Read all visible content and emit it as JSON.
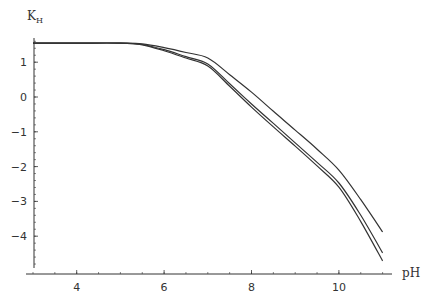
{
  "chart_data": {
    "type": "line",
    "title": "",
    "xlabel": "pH",
    "ylabel": "K",
    "ylabel_subscript": "H",
    "xlim": [
      3,
      11.1
    ],
    "ylim": [
      -5.1,
      1.7
    ],
    "grid": false,
    "legend": null,
    "x_ticks": [
      4,
      6,
      8,
      10
    ],
    "x_tick_labels": [
      "4",
      "6",
      "8",
      "10"
    ],
    "y_ticks": [
      1,
      0,
      -1,
      -2,
      -3,
      -4
    ],
    "y_tick_labels": [
      "1",
      "0",
      "-1",
      "-2",
      "-3",
      "-4"
    ],
    "line_color": "#333333",
    "series": [
      {
        "name": "curve-1",
        "x": [
          3,
          4,
          5,
          5.5,
          6,
          6.5,
          7,
          7.5,
          8,
          8.5,
          9,
          9.5,
          10,
          10.5,
          11
        ],
        "y": [
          1.55,
          1.55,
          1.55,
          1.53,
          1.42,
          1.28,
          1.12,
          0.64,
          0.14,
          -0.41,
          -0.95,
          -1.5,
          -2.1,
          -2.95,
          -3.88
        ]
      },
      {
        "name": "curve-2",
        "x": [
          3,
          4,
          5,
          5.5,
          6,
          6.5,
          7,
          7.5,
          8,
          8.5,
          9,
          9.5,
          10,
          10.5,
          11
        ],
        "y": [
          1.55,
          1.55,
          1.55,
          1.51,
          1.36,
          1.16,
          0.95,
          0.38,
          -0.2,
          -0.76,
          -1.32,
          -1.88,
          -2.47,
          -3.4,
          -4.48
        ]
      },
      {
        "name": "curve-3",
        "x": [
          3,
          4,
          5,
          5.5,
          6,
          6.5,
          7,
          7.5,
          8,
          8.5,
          9,
          9.5,
          10,
          10.5,
          11
        ],
        "y": [
          1.55,
          1.55,
          1.55,
          1.5,
          1.33,
          1.12,
          0.89,
          0.31,
          -0.29,
          -0.86,
          -1.41,
          -1.98,
          -2.59,
          -3.58,
          -4.71
        ]
      }
    ]
  }
}
